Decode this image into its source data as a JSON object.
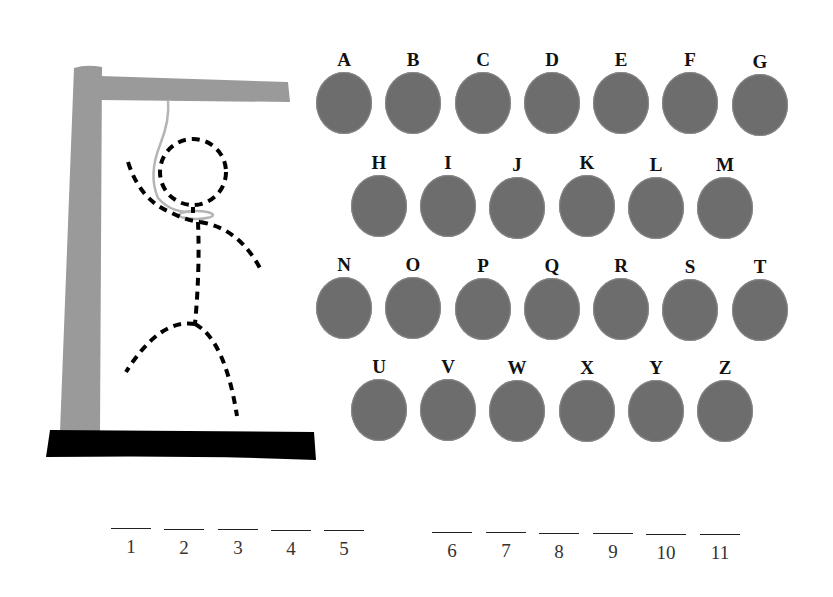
{
  "game": "Hangman",
  "colors": {
    "gallows_post": "#9a9a9a",
    "gallows_base": "#000000",
    "rope": "#b5b5b5",
    "figure": "#000000",
    "letter_disc": "#6d6d6d",
    "letter_text": "#111111"
  },
  "letters": {
    "row1": [
      "A",
      "B",
      "C",
      "D",
      "E",
      "F",
      "G"
    ],
    "row2": [
      "H",
      "I",
      "J",
      "K",
      "L",
      "M"
    ],
    "row3": [
      "N",
      "O",
      "P",
      "Q",
      "R",
      "S",
      "T"
    ],
    "row4": [
      "U",
      "V",
      "W",
      "X",
      "Y",
      "Z"
    ]
  },
  "word": {
    "group1": [
      "1",
      "2",
      "3",
      "4",
      "5"
    ],
    "group2": [
      "6",
      "7",
      "8",
      "9",
      "10",
      "11"
    ]
  },
  "figure_state": {
    "head": "dashed",
    "body": "dashed",
    "left_arm": "dashed",
    "right_arm": "dashed",
    "left_leg": "dashed",
    "right_leg": "dashed"
  }
}
